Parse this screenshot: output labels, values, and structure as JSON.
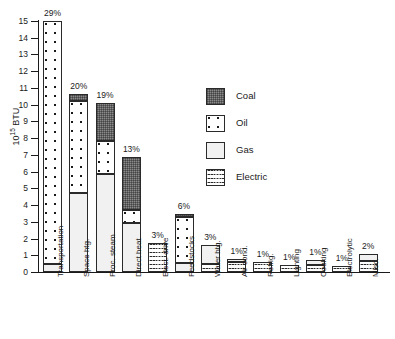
{
  "chart_data": {
    "type": "bar",
    "stacked": true,
    "title": "",
    "xlabel": "",
    "ylabel": "10^15 BTU",
    "ylabel_html": "10<sup>15</sup> BTU",
    "ylim": [
      0,
      15
    ],
    "ytick_labels": [
      "0",
      "1",
      "2",
      "3",
      "4",
      "5",
      "6",
      "7",
      "8",
      "9",
      "10",
      "11",
      "12",
      "13",
      "14",
      "15"
    ],
    "grid": false,
    "legend_position": "inside-upper-right",
    "categories": [
      "Transportation",
      "Space htg.",
      "Proc. steam",
      "Direct heat",
      "Elect. drive",
      "Feedstocks",
      "Water htg.",
      "Air cond.",
      "Refrig.",
      "Lighting",
      "Cooking",
      "Electrolytic",
      "Misc."
    ],
    "series": [
      {
        "name": "Coal",
        "values": [
          0,
          0.45,
          2.3,
          3.15,
          0,
          0.15,
          0,
          0,
          0,
          0,
          0,
          0,
          0
        ]
      },
      {
        "name": "Oil",
        "values": [
          14.5,
          5.5,
          1.95,
          0.75,
          0,
          2.75,
          0,
          0,
          0,
          0,
          0,
          0,
          0
        ]
      },
      {
        "name": "Gas",
        "values": [
          0.5,
          4.7,
          5.85,
          2.95,
          0,
          0.55,
          1.15,
          0.15,
          0,
          0,
          0.3,
          0,
          0.45
        ]
      },
      {
        "name": "Electric",
        "values": [
          0,
          0,
          0,
          0,
          1.75,
          0,
          0.45,
          0.6,
          0.6,
          0.4,
          0.4,
          0.35,
          0.65
        ]
      }
    ],
    "totals": [
      15.0,
      10.65,
      10.1,
      6.85,
      1.75,
      3.45,
      1.6,
      0.75,
      0.6,
      0.4,
      0.7,
      0.35,
      1.1
    ],
    "data_labels": [
      "29%",
      "20%",
      "19%",
      "13%",
      "3%",
      "6%",
      "3%",
      "1%",
      "1%",
      "1%",
      "1%",
      "1%",
      "2%"
    ],
    "legend": [
      {
        "label": "Coal",
        "pattern": "dark-gray-checker"
      },
      {
        "label": "Oil",
        "pattern": "white-sparse-dots"
      },
      {
        "label": "Gas",
        "pattern": "fine-stipple"
      },
      {
        "label": "Electric",
        "pattern": "horizontal-wavy-lines"
      }
    ],
    "colors": {
      "coal": "#8b8b8b",
      "oil": "#ffffff",
      "gas": "#f1f1f1",
      "electric": "#ffffff",
      "outline": "#2a2a2a",
      "axis": "#1a1a1a"
    }
  }
}
